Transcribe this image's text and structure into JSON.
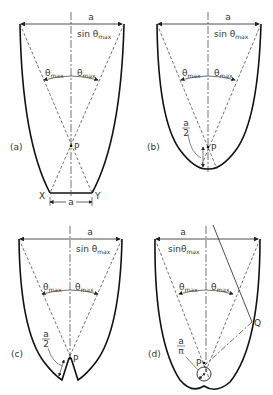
{
  "figure": {
    "panels": [
      {
        "id": "a",
        "label": "(a)",
        "top_label_num": "a",
        "top_label_den": "sin θ",
        "den_sub": "max",
        "theta_left": "θ",
        "theta_right": "θ",
        "theta_sub": "max",
        "point_label": "P",
        "bottom_left": "X",
        "bottom_right": "Y",
        "bottom_dim": "a"
      },
      {
        "id": "b",
        "label": "(b)",
        "top_label_num": "a",
        "top_label_den": "sin θ",
        "den_sub": "max",
        "theta_left": "θ",
        "theta_right": "θ",
        "theta_sub": "max",
        "point_label": "P",
        "radius_num": "a",
        "radius_den": "2"
      },
      {
        "id": "c",
        "label": "(c)",
        "top_label_num": "a",
        "top_label_den": "sin θ",
        "den_sub": "max",
        "theta_left": "θ",
        "theta_right": "θ",
        "theta_sub": "max",
        "point_label": "P",
        "radius_num": "a",
        "radius_den": "2"
      },
      {
        "id": "d",
        "label": "(d)",
        "top_label_num": "a",
        "top_label_den": "sinθ",
        "den_sub": "max",
        "theta_left": "θ",
        "theta_right": "θ",
        "theta_sub": "max",
        "point_label": "P",
        "point_q": "Q",
        "radius_num": "a",
        "radius_den": "π"
      }
    ]
  }
}
